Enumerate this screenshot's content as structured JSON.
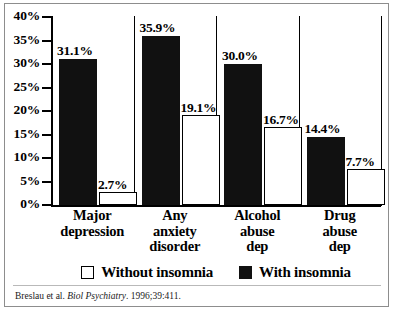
{
  "chart_data": {
    "type": "bar",
    "title": "",
    "subtitle": "",
    "xlabel": "",
    "ylabel": "",
    "ylim": [
      0,
      40
    ],
    "ytick_labels": [
      "40%",
      "35%",
      "30%",
      "25%",
      "20%",
      "15%",
      "10%",
      "5%",
      "0%"
    ],
    "ytick_values": [
      40,
      35,
      30,
      25,
      20,
      15,
      10,
      5,
      0
    ],
    "grid": false,
    "legend_position": "below-axis",
    "categories": [
      "Major depression",
      "Any anxiety disorder",
      "Alcohol abuse dep",
      "Drug abuse dep"
    ],
    "category_lines": [
      [
        "Major",
        "depression"
      ],
      [
        "Any",
        "anxiety",
        "disorder"
      ],
      [
        "Alcohol",
        "abuse",
        "dep"
      ],
      [
        "Drug",
        "abuse",
        "dep"
      ]
    ],
    "series": [
      {
        "name": "With insomnia",
        "color": "#111111",
        "style": "filled",
        "values": [
          31.1,
          35.9,
          30.0,
          14.4
        ],
        "labels": [
          "31.1%",
          "35.9%",
          "30.0%",
          "14.4%"
        ]
      },
      {
        "name": "Without insomnia",
        "color": "#ffffff",
        "style": "open-outlined",
        "values": [
          2.7,
          19.1,
          16.7,
          7.7
        ],
        "labels": [
          "2.7%",
          "19.1%",
          "16.7%",
          "7.7%"
        ]
      }
    ]
  },
  "legend": {
    "items": [
      {
        "label": "Without insomnia",
        "style": "open"
      },
      {
        "label": "With insomnia",
        "style": "filled"
      }
    ]
  },
  "citation": {
    "authors": "Breslau et al.",
    "journal": "Biol Psychiatry",
    "source": ". 1996;39:411.",
    "full": "Breslau et al. Biol Psychiatry. 1996;39:411."
  }
}
